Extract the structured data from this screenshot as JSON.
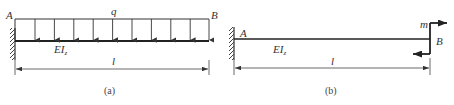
{
  "figure_a": {
    "caption": "(a)",
    "left_end_label": "A",
    "right_end_label": "B",
    "load_label": "q",
    "stiffness_label": "EI",
    "stiffness_subscript": "z",
    "length_label": "l",
    "support": "fixed-wall-left",
    "load_type": "uniform-distributed-downward",
    "load_arrow_count": 11
  },
  "figure_b": {
    "caption": "(b)",
    "left_end_label": "A",
    "right_end_label": "B",
    "moment_label": "m",
    "stiffness_label": "EI",
    "stiffness_subscript": "z",
    "length_label": "l",
    "support": "fixed-wall-left",
    "load_type": "concentrated-moment-at-free-end"
  },
  "colors": {
    "line": "#333333",
    "text": "#333333",
    "background": "#ffffff"
  }
}
